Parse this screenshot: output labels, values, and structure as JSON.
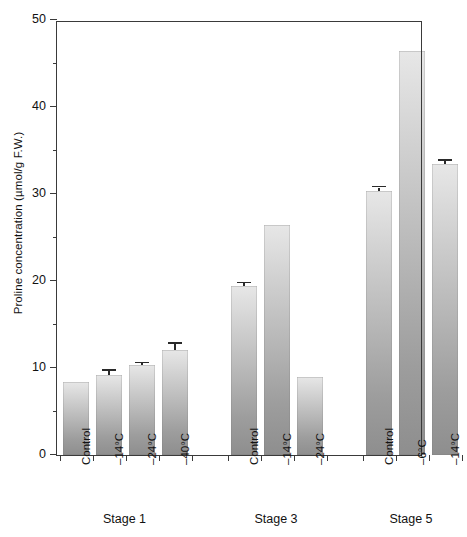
{
  "chart_data": {
    "type": "bar",
    "title": "",
    "xlabel": "",
    "ylabel": "Proline concentration (µmol/g F.W.)",
    "ylim": [
      0,
      50
    ],
    "ytick_labels": [
      "0",
      "10",
      "20",
      "30",
      "40",
      "50"
    ],
    "ytick_values": [
      0,
      10,
      20,
      30,
      40,
      50
    ],
    "yminor_values": [
      5,
      15,
      25,
      35,
      45
    ],
    "grid": false,
    "legend": "none",
    "groups": [
      {
        "label": "Stage 1",
        "categories": [
          "Control",
          "–14°C",
          "–24°C",
          "–40°C"
        ],
        "values": [
          8.4,
          9.2,
          10.3,
          12.1
        ],
        "errors": [
          0.0,
          0.5,
          0.25,
          0.7
        ]
      },
      {
        "label": "Stage 3",
        "categories": [
          "Control",
          "–14°C",
          "–24°C"
        ],
        "values": [
          19.4,
          26.4,
          9.0
        ],
        "errors": [
          0.35,
          0.0,
          0.0
        ]
      },
      {
        "label": "Stage 5",
        "categories": [
          "Control",
          "–6°C",
          "–14°C"
        ],
        "values": [
          30.4,
          46.4,
          33.5
        ],
        "errors": [
          0.35,
          0.0,
          0.35
        ]
      }
    ]
  }
}
